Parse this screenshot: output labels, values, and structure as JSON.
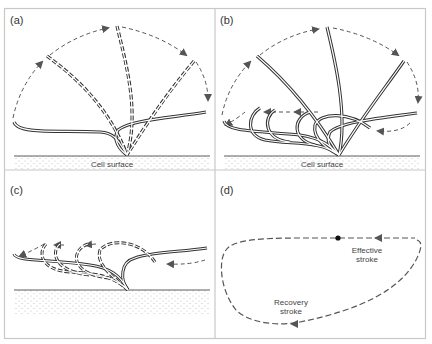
{
  "figure": {
    "panels": [
      {
        "id": "a",
        "label": "(a)",
        "surface_label": "Cell surface"
      },
      {
        "id": "b",
        "label": "(b)",
        "surface_label": "Cell surface"
      },
      {
        "id": "c",
        "label": "(c)"
      },
      {
        "id": "d",
        "label": "(d)",
        "effective_line1": "Effective",
        "effective_line2": "stroke",
        "recovery_line1": "Recovery",
        "recovery_line2": "stroke"
      }
    ],
    "colors": {
      "border": "#c8c8c8",
      "line": "#333333",
      "arrow": "#555555",
      "dots": "#9a9a9a"
    }
  }
}
